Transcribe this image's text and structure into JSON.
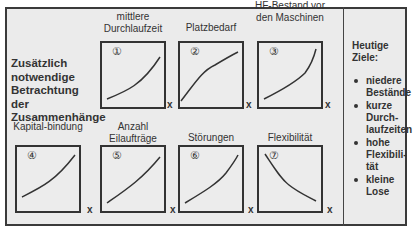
{
  "heading": "Zusätzlich notwendige Betrachtung der Zusammenhänge",
  "axis_label": "x",
  "charts": [
    {
      "num": "①",
      "label": "mittlere Durchlaufzeit",
      "trend": "convex increasing"
    },
    {
      "num": "②",
      "label": "Platzbedarf",
      "trend": "concave increasing"
    },
    {
      "num": "③",
      "label": "HF-Bestand vor den Maschinen",
      "trend": "convex increasing, steep at end"
    },
    {
      "num": "④",
      "label": "Kapital-bindung",
      "trend": "convex increasing"
    },
    {
      "num": "⑤",
      "label": "Anzahl Eilaufträge",
      "trend": "slightly convex increasing"
    },
    {
      "num": "⑥",
      "label": "Störungen",
      "trend": "convex increasing"
    },
    {
      "num": "⑦",
      "label": "Flexibilität",
      "trend": "convex decreasing"
    }
  ],
  "goals": {
    "title": "Heutige Ziele:",
    "items": [
      "niedere Bestände",
      "kurze Durch-laufzeiten",
      "hohe Flexibili-tät",
      "kleine Lose"
    ]
  }
}
